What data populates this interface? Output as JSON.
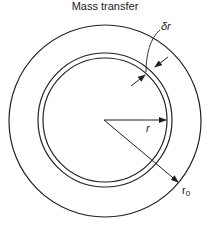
{
  "title": "Mass transfer",
  "labels": {
    "delta_r": "δr",
    "r": "r",
    "r0_base": "r",
    "r0_sub": "0"
  },
  "geometry": {
    "center": [
      104,
      120
    ],
    "outer_radius": 96,
    "shell_outer_radius": 67,
    "shell_inner_radius": 62
  },
  "colors": {
    "line": "#222222",
    "background": "#ffffff"
  }
}
